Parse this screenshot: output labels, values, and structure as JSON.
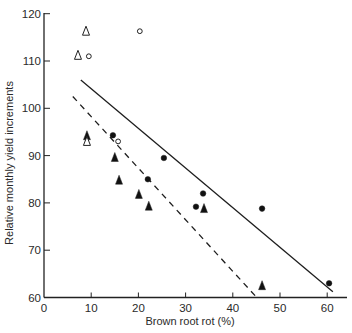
{
  "chart_data": {
    "type": "scatter",
    "title": "",
    "xlabel": "Brown root rot (%)",
    "ylabel": "Relative monthly yield increments",
    "xlim": [
      0,
      64
    ],
    "ylim": [
      60,
      120
    ],
    "x_ticks": [
      0,
      10,
      20,
      30,
      40,
      50,
      60
    ],
    "y_ticks": [
      60,
      70,
      80,
      90,
      100,
      110,
      120
    ],
    "x_tick_labels": [
      "0",
      "10",
      "20",
      "30",
      "40",
      "50",
      "60"
    ],
    "y_tick_labels": [
      "60",
      "70",
      "80",
      "90",
      "100",
      "110",
      "120"
    ],
    "grid": false,
    "legend": null,
    "series": [
      {
        "name": "filled-circle",
        "marker": "circle",
        "filled": true,
        "points": [
          [
            14.6,
            94.3
          ],
          [
            22,
            85
          ],
          [
            25.4,
            89.5
          ],
          [
            33.7,
            82
          ],
          [
            32.2,
            79.2
          ],
          [
            46.2,
            78.8
          ],
          [
            60.4,
            63
          ]
        ]
      },
      {
        "name": "filled-triangle",
        "marker": "triangle",
        "filled": true,
        "points": [
          [
            9.1,
            94.2
          ],
          [
            15,
            89.6
          ],
          [
            15.9,
            84.8
          ],
          [
            20.1,
            81.8
          ],
          [
            22.2,
            79.3
          ],
          [
            33.9,
            78.8
          ],
          [
            46.2,
            62.5
          ]
        ]
      },
      {
        "name": "open-circle",
        "marker": "circle",
        "filled": false,
        "points": [
          [
            20.3,
            116.3
          ],
          [
            9.5,
            111
          ],
          [
            15.7,
            93
          ]
        ]
      },
      {
        "name": "open-triangle",
        "marker": "triangle",
        "filled": false,
        "points": [
          [
            8.9,
            116.3
          ],
          [
            7.2,
            111.2
          ],
          [
            9.1,
            93
          ]
        ]
      }
    ],
    "lines": [
      {
        "name": "regression-solid",
        "style": "solid",
        "from": [
          7.8,
          106
        ],
        "to": [
          61.2,
          61.2
        ]
      },
      {
        "name": "regression-dashed",
        "style": "dashed",
        "from": [
          6.1,
          102.5
        ],
        "to": [
          44.8,
          60.3
        ]
      }
    ]
  }
}
